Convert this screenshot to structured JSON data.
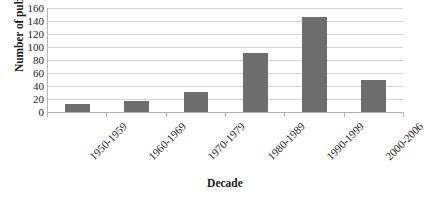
{
  "chart_data": {
    "type": "bar",
    "title": "",
    "subtitle": "",
    "categories": [
      "1950-1959",
      "1960-1969",
      "1970-1979",
      "1980-1989",
      "1990-1999",
      "2000-2006"
    ],
    "values": [
      12,
      17,
      31,
      91,
      146,
      50
    ],
    "xlabel": "Decade",
    "ylabel": "Number of publications",
    "ylim": [
      0,
      160
    ],
    "ytick_labels": [
      "0",
      "20",
      "40",
      "60",
      "80",
      "100",
      "120",
      "140",
      "160"
    ],
    "ytick_values": [
      0,
      20,
      40,
      60,
      80,
      100,
      120,
      140,
      160
    ],
    "grid": true,
    "legend": "none",
    "bar_color": "#6e6e6e",
    "gridline_color": "#d4d4d4",
    "axis_color": "#b0b0b0",
    "background_color": "#ffffff",
    "xtick_label_rotation": -45
  }
}
